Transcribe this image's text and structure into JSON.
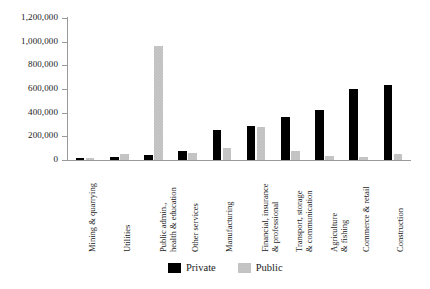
{
  "chart_data": {
    "type": "bar",
    "title": "",
    "subtitle": "",
    "xlabel": "",
    "ylabel": "",
    "ylim": [
      0,
      1200000
    ],
    "ytick_step": 200000,
    "grid": false,
    "legend_position": "bottom-center",
    "categories": [
      "Mining & quarrying",
      "Utilities",
      "Public admin., health & education",
      "Other services",
      "Manufacturing",
      "Financial, insurance & professional",
      "Transport, storage & communication",
      "Agriculture & fishing",
      "Commerce & retail",
      "Construction"
    ],
    "category_lines": [
      [
        "Mining & quarrying"
      ],
      [
        "Utilities"
      ],
      [
        "Public admin.,",
        "health  & education"
      ],
      [
        "Other services"
      ],
      [
        "Manufacturing"
      ],
      [
        "Financial, insurance",
        "& professional"
      ],
      [
        "Transport, storage",
        "& communication"
      ],
      [
        "Agriculture",
        "& fishing"
      ],
      [
        "Commerce & retail"
      ],
      [
        "Construction"
      ]
    ],
    "ytick_labels": [
      "0",
      "200,000",
      "400,000",
      "600,000",
      "800,000",
      "1,000,000",
      "1,200,000"
    ],
    "ytick_values": [
      0,
      200000,
      400000,
      600000,
      800000,
      1000000,
      1200000
    ],
    "series": [
      {
        "name": "Private",
        "color": "#000000",
        "values": [
          20000,
          25000,
          40000,
          75000,
          250000,
          290000,
          360000,
          420000,
          600000,
          633000
        ]
      },
      {
        "name": "Public",
        "color": "#c8c8c8",
        "values": [
          18000,
          55000,
          965000,
          62000,
          100000,
          280000,
          75000,
          30000,
          22000,
          48000
        ]
      }
    ]
  },
  "legend": {
    "items": [
      {
        "label": "Private",
        "swatch": "black-square-swatch"
      },
      {
        "label": "Public",
        "swatch": "gray-square-swatch"
      }
    ]
  },
  "axes": {
    "y_axis_name": "y-axis",
    "x_axis_name": "x-axis"
  }
}
